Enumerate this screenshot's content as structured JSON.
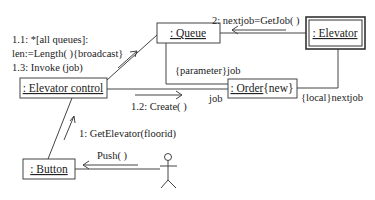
{
  "diagram": {
    "type": "UML collaboration diagram",
    "objects": {
      "elevator_control": ": Elevator control",
      "queue": ": Queue",
      "elevator": ": Elevator",
      "order": ": Order",
      "order_constraint": "{new}",
      "button": ": Button"
    },
    "messages": {
      "m1_1_line1": "1.1: *[all queues]:",
      "m1_1_line2": "len:=Length( ){broadcast}",
      "m1_3": "1.3: Invoke (job)",
      "m2": "2: nextjob=GetJob( )",
      "m1_2": "1.2: Create( )",
      "m1": "1:  GetElevator(floorid)",
      "push": "Push(  )"
    },
    "link_labels": {
      "parameter_job": "{parameter}job",
      "job": "job",
      "local_nextjob": "{local}nextjob"
    },
    "actor": "user"
  }
}
